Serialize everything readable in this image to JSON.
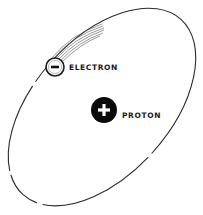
{
  "diagram": {
    "type": "atom-model",
    "labels": {
      "electron": "ELECTRON",
      "proton": "PROTON"
    },
    "symbols": {
      "electron_charge": "minus-sign",
      "proton_charge": "plus-sign"
    },
    "colors": {
      "background": "#ffffff",
      "line": "#2a2a2a",
      "proton_fill": "#0a0a0a",
      "electron_fill": "#ffffff"
    },
    "geometry": {
      "orbit": {
        "cx": 102,
        "cy": 107,
        "rx": 118,
        "ry": 68,
        "rotation_deg": -48
      },
      "electron": {
        "cx": 55,
        "cy": 67,
        "r": 9
      },
      "proton": {
        "cx": 104,
        "cy": 110,
        "r": 13
      }
    }
  }
}
